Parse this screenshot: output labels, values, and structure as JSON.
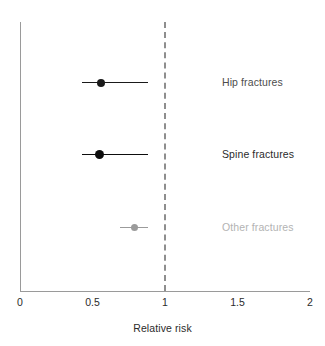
{
  "chart_data": {
    "type": "scatter",
    "subtype": "forest-plot",
    "title": "",
    "xlabel": "Relative risk",
    "ylabel": "",
    "xlim": [
      0,
      2
    ],
    "ylim": [
      0,
      4
    ],
    "grid": false,
    "legend": "none",
    "xticks": [
      0,
      0.5,
      1,
      1.5,
      2
    ],
    "xticklabels": [
      "0",
      "0.5",
      "1",
      "1.5",
      "2"
    ],
    "reference_line": {
      "value": 1,
      "style": "dashed",
      "color": "#8e8e8e",
      "label": "1"
    },
    "categories": [
      "Hip fractures",
      "Spine fractures",
      "Other fractures"
    ],
    "values": [
      0.56,
      0.55,
      0.79
    ],
    "ci_low": [
      0.43,
      0.43,
      0.69
    ],
    "ci_high": [
      0.88,
      0.88,
      0.88
    ],
    "series": [
      {
        "name": "Hip fractures",
        "estimate": 0.56,
        "ci_low": 0.43,
        "ci_high": 0.88,
        "color": "#1a1a1a",
        "marker_size": 8,
        "label_color": "#4d4d4d"
      },
      {
        "name": "Spine fractures",
        "estimate": 0.55,
        "ci_low": 0.43,
        "ci_high": 0.88,
        "color": "#0d0d0d",
        "marker_size": 9,
        "label_color": "#2b2b2b"
      },
      {
        "name": "Other fractures",
        "estimate": 0.79,
        "ci_low": 0.69,
        "ci_high": 0.88,
        "color": "#9b9b9b",
        "marker_size": 7,
        "label_color": "#b3b3b3"
      }
    ]
  },
  "axis": {
    "x_title": "Relative risk",
    "ticks": [
      {
        "label": "0",
        "value": 0
      },
      {
        "label": "0.5",
        "value": 0.5
      },
      {
        "label": "1",
        "value": 1
      },
      {
        "label": "1.5",
        "value": 1.5
      },
      {
        "label": "2",
        "value": 2
      }
    ],
    "spine_color": "#9a9a9a"
  },
  "rows": [
    {
      "label": "Hip fractures",
      "label_color": "#4d4d4d"
    },
    {
      "label": "Spine fractures",
      "label_color": "#2b2b2b"
    },
    {
      "label": "Other fractures",
      "label_color": "#b3b3b3"
    }
  ],
  "colors": {
    "background": "#ffffff",
    "axis": "#9a9a9a",
    "reference": "#8e8e8e",
    "marker_dark": "#0d0d0d",
    "marker_gray": "#9b9b9b",
    "text": "#2b2b2b"
  }
}
